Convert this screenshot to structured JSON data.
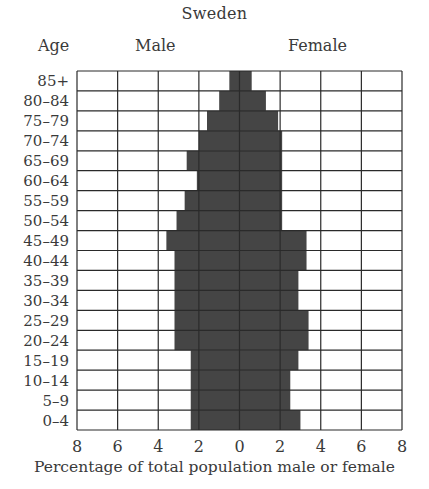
{
  "chart_data": {
    "type": "bar",
    "orientation": "horizontal",
    "subtype": "population-pyramid",
    "title": "Sweden",
    "ylabel": "Age",
    "xlabel": "Percentage of total population male or female",
    "left_label": "Male",
    "right_label": "Female",
    "categories": [
      "85+",
      "80-84",
      "75-79",
      "70-74",
      "65-69",
      "60-64",
      "55-59",
      "50-54",
      "45-49",
      "40-44",
      "35-39",
      "30-34",
      "25-29",
      "20-24",
      "15-19",
      "10-14",
      "5-9",
      "0-4"
    ],
    "series": [
      {
        "name": "Male",
        "values": [
          0.5,
          1.0,
          1.6,
          2.0,
          2.6,
          2.1,
          2.7,
          3.1,
          3.6,
          3.2,
          3.2,
          3.2,
          3.2,
          3.2,
          2.4,
          2.4,
          2.4,
          2.4
        ]
      },
      {
        "name": "Female",
        "values": [
          0.6,
          1.3,
          1.9,
          2.1,
          2.1,
          2.1,
          2.1,
          2.1,
          3.3,
          3.3,
          2.9,
          2.9,
          3.4,
          3.4,
          2.9,
          2.5,
          2.5,
          3.0
        ]
      }
    ],
    "xticks": [
      "8",
      "6",
      "4",
      "2",
      "0",
      "2",
      "4",
      "6",
      "8"
    ],
    "xlim": [
      -8,
      8
    ],
    "grid": true,
    "colors": {
      "bar": "#454545",
      "grid": "#2a2a2a",
      "text": "#3a3a3a"
    }
  }
}
